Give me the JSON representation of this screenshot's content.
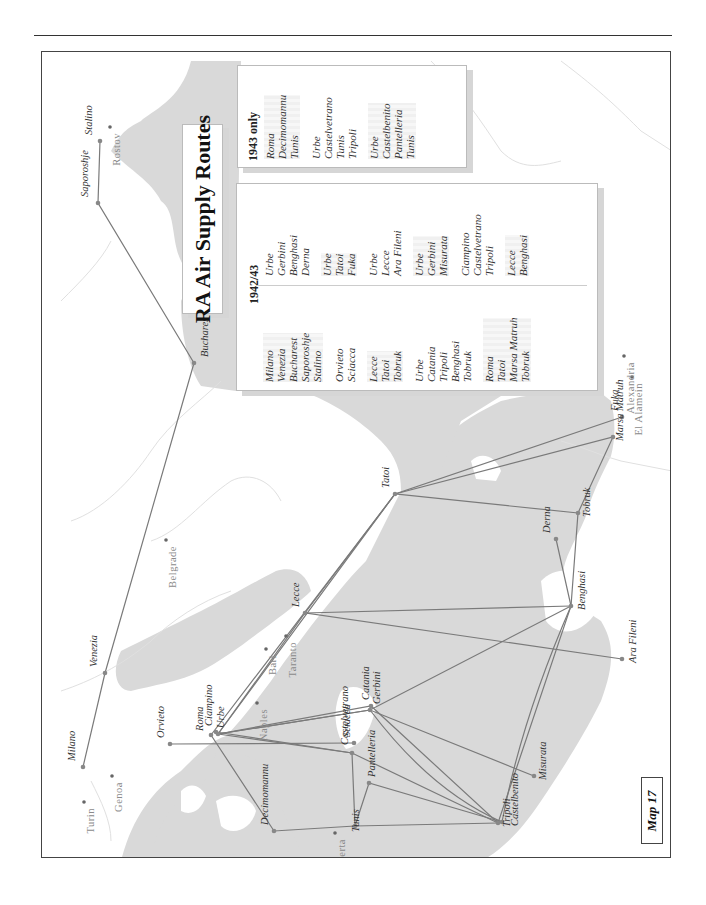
{
  "map": {
    "title": "RA Air Supply Routes",
    "map_number": "Map 17",
    "orientation": "rotated 90° counter-clockwise on page",
    "colors": {
      "sea": "#d9d9d9",
      "land": "#ffffff",
      "route_line": "#7a7a7a",
      "route_point": "#888888",
      "border": "#e2e2e2"
    }
  },
  "places": {
    "airfields": [
      {
        "name": "Milano",
        "x": 82,
        "y": 766
      },
      {
        "name": "Venezia",
        "x": 104,
        "y": 672
      },
      {
        "name": "Bucharest",
        "x": 193,
        "y": 362
      },
      {
        "name": "Saporoshje",
        "x": 97,
        "y": 202
      },
      {
        "name": "Stalino",
        "x": 99,
        "y": 140
      },
      {
        "name": "Orvieto",
        "x": 169,
        "y": 743
      },
      {
        "name": "Roma",
        "x": 210,
        "y": 734
      },
      {
        "name": "Ciampino",
        "x": 215,
        "y": 731
      },
      {
        "name": "Urbe",
        "x": 217,
        "y": 733
      },
      {
        "name": "Decimomannu",
        "x": 273,
        "y": 830
      },
      {
        "name": "Sciacca",
        "x": 353,
        "y": 742
      },
      {
        "name": "Castelvetrano",
        "x": 351,
        "y": 752
      },
      {
        "name": "Pantelleria",
        "x": 368,
        "y": 782
      },
      {
        "name": "Tunis",
        "x": 354,
        "y": 825
      },
      {
        "name": "Gerbini",
        "x": 369,
        "y": 709
      },
      {
        "name": "Catania",
        "x": 370,
        "y": 705
      },
      {
        "name": "Lecce",
        "x": 304,
        "y": 612
      },
      {
        "name": "Tatoi",
        "x": 394,
        "y": 493
      },
      {
        "name": "Tripoli",
        "x": 497,
        "y": 822
      },
      {
        "name": "Castelbenito",
        "x": 501,
        "y": 821
      },
      {
        "name": "Misurata",
        "x": 533,
        "y": 775
      },
      {
        "name": "Benghasi",
        "x": 570,
        "y": 605
      },
      {
        "name": "Derna",
        "x": 555,
        "y": 538
      },
      {
        "name": "Tobruk",
        "x": 577,
        "y": 512
      },
      {
        "name": "Marsa Matruh",
        "x": 612,
        "y": 436
      },
      {
        "name": "Fuka",
        "x": 621,
        "y": 416
      },
      {
        "name": "Ara Fileni",
        "x": 621,
        "y": 658
      }
    ],
    "reference_cities": [
      {
        "name": "Turin",
        "x": 83,
        "y": 801
      },
      {
        "name": "Genoa",
        "x": 111,
        "y": 775
      },
      {
        "name": "Naples",
        "x": 256,
        "y": 702
      },
      {
        "name": "Bari",
        "x": 265,
        "y": 648
      },
      {
        "name": "Taranto",
        "x": 285,
        "y": 635
      },
      {
        "name": "Belgrade",
        "x": 165,
        "y": 539
      },
      {
        "name": "Bizerta",
        "x": 334,
        "y": 832
      },
      {
        "name": "Rostov",
        "x": 109,
        "y": 126
      },
      {
        "name": "Alexandria",
        "x": 623,
        "y": 355
      },
      {
        "name": "El Alamein",
        "x": 631,
        "y": 376
      }
    ]
  },
  "legend": {
    "period_1942_43": {
      "heading": "1942/43",
      "left_column": [
        [
          "Milano",
          "Venezia",
          "Bucharest",
          "Saporoshje",
          "Stalino"
        ],
        [
          "Orvieto",
          "Sciacca"
        ],
        [
          "Lecce",
          "Tatoi",
          "Tobruk"
        ],
        [
          "Urbe",
          "Catania",
          "Tripoli",
          "Benghasi",
          "Tobruk"
        ],
        [
          "Roma",
          "Tatoi",
          "Marsa Matruh",
          "Tobruk"
        ]
      ],
      "right_column": [
        [
          "Urbe",
          "Gerbini",
          "Benghasi",
          "Derna"
        ],
        [
          "Urbe",
          "Tatoi",
          "Fuka"
        ],
        [
          "Urbe",
          "Lecce",
          "Ara Fileni"
        ],
        [
          "Urbe",
          "Gerbini",
          "Misurata"
        ],
        [
          "Ciampino",
          "Castelvetrano",
          "Tripoli"
        ],
        [
          "Lecce",
          "Benghasi"
        ]
      ]
    },
    "period_1943_only": {
      "heading": "1943 only",
      "routes": [
        [
          "Roma",
          "Decimomannu",
          "Tunis"
        ],
        [
          "Urbe",
          "Castelvetrano",
          "Tunis",
          "Tripoli"
        ],
        [
          "Urbe",
          "Castelbenito",
          "Pantelleria",
          "Tunis"
        ]
      ]
    }
  }
}
